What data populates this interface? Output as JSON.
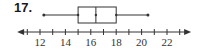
{
  "problem": {
    "number": "17."
  },
  "colors": {
    "stroke": "#333333",
    "text": "#1a1a1a"
  },
  "chart_data": {
    "type": "boxplot",
    "title": "",
    "xlabel": "",
    "ylabel": "",
    "axis": {
      "min_visible": 10.2,
      "max_visible": 23.9,
      "tick_step": 1,
      "labeled_ticks": [
        12,
        14,
        16,
        18,
        20,
        22
      ],
      "arrows": "both"
    },
    "box": {
      "min": 12.3,
      "q1": 15,
      "median": 16.4,
      "q3": 18,
      "max": 20.5
    }
  }
}
